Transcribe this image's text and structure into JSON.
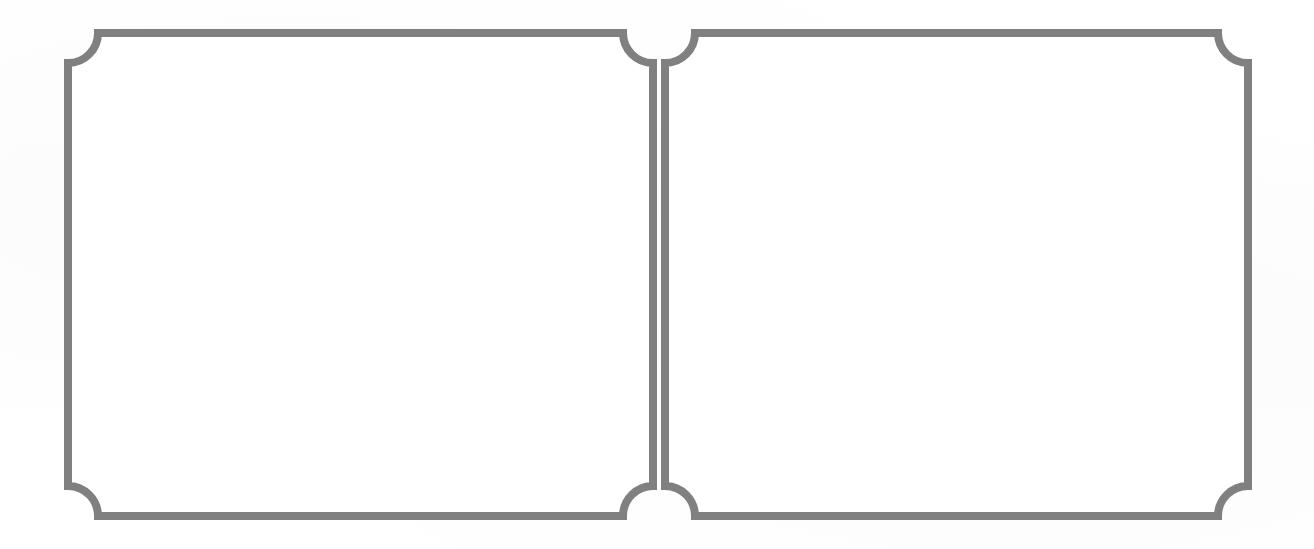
{
  "document": {
    "kind": "scanned-blank-form",
    "description": "Two blank bordered panels side by side on white paper",
    "canvas": {
      "width": 1314,
      "height": 549
    },
    "background_color": "#ffffff"
  },
  "style": {
    "border_color": "#808080",
    "border_width": 8,
    "interior_color": "#ffffff",
    "corner_notch_radius": 30,
    "corner_style": "concave-quarter-circle"
  },
  "panels": [
    {
      "id": "left-panel",
      "label": "",
      "content": "",
      "bounds": {
        "x": 68,
        "y": 33,
        "width": 585,
        "height": 483
      },
      "corners": {
        "top_left": "concave",
        "top_right": "concave",
        "bottom_right": "concave",
        "bottom_left": "concave"
      }
    },
    {
      "id": "right-panel",
      "label": "",
      "content": "",
      "bounds": {
        "x": 665,
        "y": 33,
        "width": 583,
        "height": 483
      },
      "corners": {
        "top_left": "concave",
        "top_right": "concave",
        "bottom_right": "concave",
        "bottom_left": "concave"
      }
    }
  ],
  "gap": {
    "between_panels_px": 12,
    "center_x": 659
  }
}
